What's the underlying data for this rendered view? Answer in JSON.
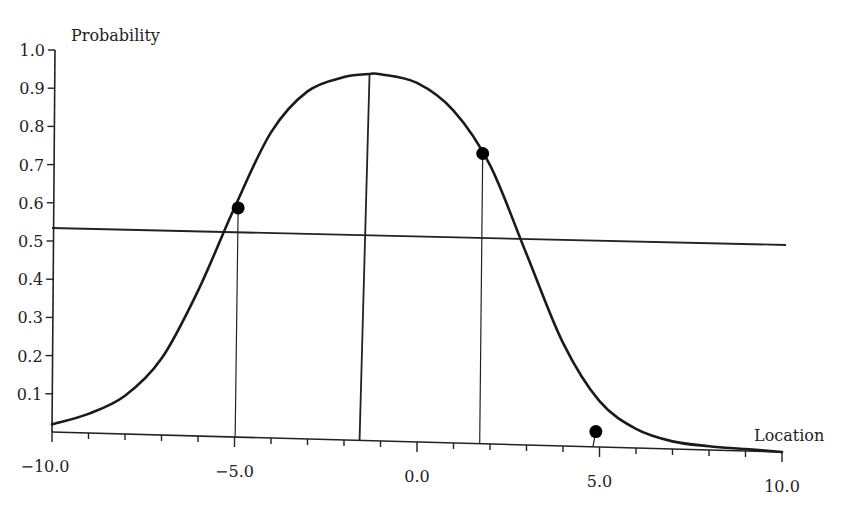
{
  "chart_data": {
    "type": "line",
    "title": "",
    "xlabel": "Location",
    "ylabel": "Probability",
    "xlim": [
      -10,
      10
    ],
    "ylim": [
      0,
      1.0
    ],
    "grid": false,
    "legend": null,
    "x_ticks": [
      -10.0,
      -5.0,
      0.0,
      5.0,
      10.0
    ],
    "x_tick_labels": [
      "−10.0",
      "−5.0",
      "0.0",
      "5.0",
      "10.0"
    ],
    "y_ticks": [
      1.0,
      0.9,
      0.8,
      0.7,
      0.6,
      0.5,
      0.4,
      0.3,
      0.2,
      0.1
    ],
    "y_tick_labels": [
      "1.0",
      "0.9",
      "0.8",
      "0.7",
      "0.6",
      "0.5",
      "0.4",
      "0.3",
      "0.2",
      "0.1"
    ],
    "series": [
      {
        "name": "probability-curve",
        "kind": "curve",
        "x": [
          -10,
          -9,
          -8,
          -7,
          -6,
          -5,
          -4,
          -3,
          -2,
          -1.3,
          -1,
          0,
          1,
          2,
          3,
          4,
          5,
          6,
          7,
          8,
          9,
          10
        ],
        "y": [
          0.02,
          0.05,
          0.1,
          0.2,
          0.38,
          0.6,
          0.8,
          0.91,
          0.95,
          0.96,
          0.96,
          0.94,
          0.87,
          0.73,
          0.5,
          0.27,
          0.12,
          0.05,
          0.02,
          0.01,
          0.005,
          0.0
        ]
      }
    ],
    "points": [
      {
        "x": -4.9,
        "y": 0.6
      },
      {
        "x": 1.8,
        "y": 0.76
      },
      {
        "x": 4.9,
        "y": 0.04
      }
    ],
    "reference_lines": [
      {
        "type": "horizontal",
        "y": 0.5,
        "label": "0.5 threshold"
      },
      {
        "type": "vertical",
        "x": -1.3,
        "from_y": 0,
        "to_y": 0.96,
        "label": "peak location"
      },
      {
        "type": "vertical",
        "x": -4.9,
        "from_y": 0,
        "to_y": 0.6
      },
      {
        "type": "vertical",
        "x": 1.8,
        "from_y": 0,
        "to_y": 0.76
      },
      {
        "type": "vertical",
        "x": 4.9,
        "from_y": 0,
        "to_y": 0.04
      }
    ]
  }
}
